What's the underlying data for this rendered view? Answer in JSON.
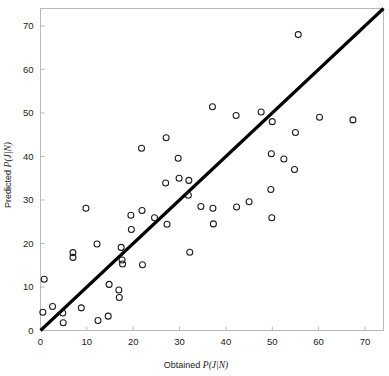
{
  "chart_data": {
    "type": "scatter",
    "title": "",
    "xlabel": "Obtained P(J|N)",
    "ylabel": "Predicted P(J|N)",
    "xlim": [
      0,
      74
    ],
    "ylim": [
      0,
      74
    ],
    "xticks": [
      0,
      10,
      20,
      30,
      40,
      50,
      60,
      70
    ],
    "yticks": [
      0,
      10,
      20,
      30,
      40,
      50,
      60,
      70
    ],
    "xtick_labels": [
      "0",
      "10",
      "20",
      "30",
      "40",
      "50",
      "60",
      "70"
    ],
    "ytick_labels": [
      "0",
      "10",
      "20",
      "30",
      "40",
      "50",
      "60",
      "70"
    ],
    "grid": false,
    "legend": null,
    "marker": "open-circle",
    "marker_color": "#1c1c1c",
    "reference_line": {
      "name": "identity-line",
      "description": "y = x diagonal reference line",
      "from": [
        0,
        0
      ],
      "to": [
        74,
        74
      ],
      "color": "#000000",
      "width": 3.1
    },
    "points": [
      [
        0.5,
        4.2
      ],
      [
        0.8,
        11.8
      ],
      [
        2.6,
        5.5
      ],
      [
        4.8,
        4.0
      ],
      [
        4.9,
        1.8
      ],
      [
        7.0,
        17.9
      ],
      [
        7.0,
        16.8
      ],
      [
        8.8,
        5.2
      ],
      [
        9.8,
        28.1
      ],
      [
        12.2,
        19.9
      ],
      [
        12.4,
        2.3
      ],
      [
        14.6,
        3.3
      ],
      [
        14.8,
        10.6
      ],
      [
        16.9,
        9.3
      ],
      [
        17.0,
        7.6
      ],
      [
        17.4,
        19.1
      ],
      [
        17.6,
        16.2
      ],
      [
        17.7,
        15.3
      ],
      [
        19.5,
        26.5
      ],
      [
        19.6,
        23.2
      ],
      [
        21.8,
        41.9
      ],
      [
        21.9,
        27.6
      ],
      [
        22.0,
        15.1
      ],
      [
        24.6,
        25.9
      ],
      [
        27.0,
        33.9
      ],
      [
        27.1,
        44.3
      ],
      [
        27.3,
        24.4
      ],
      [
        29.7,
        39.6
      ],
      [
        29.9,
        35.0
      ],
      [
        31.9,
        31.1
      ],
      [
        32.0,
        34.5
      ],
      [
        32.2,
        18.0
      ],
      [
        34.6,
        28.5
      ],
      [
        37.1,
        51.4
      ],
      [
        37.2,
        28.1
      ],
      [
        37.3,
        24.5
      ],
      [
        42.2,
        49.4
      ],
      [
        42.3,
        28.4
      ],
      [
        45.0,
        29.6
      ],
      [
        47.6,
        50.2
      ],
      [
        49.7,
        32.4
      ],
      [
        49.8,
        40.6
      ],
      [
        49.9,
        25.9
      ],
      [
        50.0,
        48.0
      ],
      [
        52.5,
        39.4
      ],
      [
        54.8,
        37.0
      ],
      [
        55.0,
        45.5
      ],
      [
        55.6,
        68.0
      ],
      [
        60.2,
        49.0
      ],
      [
        67.4,
        48.4
      ]
    ]
  },
  "axes": {
    "x_axis_name": "x-axis",
    "y_axis_name": "y-axis"
  }
}
